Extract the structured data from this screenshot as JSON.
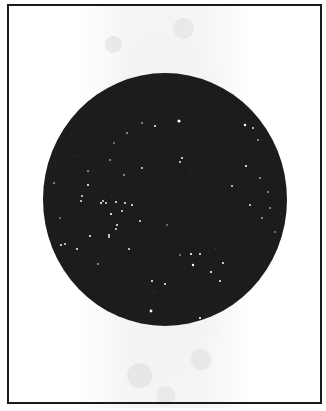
{
  "figure": {
    "frame_color": "#1a1a1a",
    "sky_color": "#1c1c1c",
    "star_color": "#ffffff",
    "circle": {
      "cx": 165,
      "cy": 199.5,
      "rx": 122,
      "ry": 126.5
    },
    "stars": [
      {
        "x": 179,
        "y": 121,
        "r": 1.6
      },
      {
        "x": 155,
        "y": 126,
        "r": 1.0
      },
      {
        "x": 245,
        "y": 125,
        "r": 1.2
      },
      {
        "x": 253,
        "y": 128,
        "r": 0.9
      },
      {
        "x": 258,
        "y": 140,
        "r": 0.8
      },
      {
        "x": 182,
        "y": 158,
        "r": 1.0
      },
      {
        "x": 180,
        "y": 162,
        "r": 0.9
      },
      {
        "x": 246,
        "y": 166,
        "r": 1.1
      },
      {
        "x": 260,
        "y": 178,
        "r": 0.8
      },
      {
        "x": 232,
        "y": 186,
        "r": 0.9
      },
      {
        "x": 268,
        "y": 192,
        "r": 0.8
      },
      {
        "x": 250,
        "y": 205,
        "r": 0.9
      },
      {
        "x": 270,
        "y": 208,
        "r": 0.8
      },
      {
        "x": 262,
        "y": 218,
        "r": 0.8
      },
      {
        "x": 142,
        "y": 123,
        "r": 0.8
      },
      {
        "x": 127,
        "y": 133,
        "r": 0.8
      },
      {
        "x": 114,
        "y": 143,
        "r": 0.7
      },
      {
        "x": 110,
        "y": 160,
        "r": 0.8
      },
      {
        "x": 142,
        "y": 168,
        "r": 0.9
      },
      {
        "x": 124,
        "y": 175,
        "r": 0.8
      },
      {
        "x": 88,
        "y": 171,
        "r": 0.8
      },
      {
        "x": 54,
        "y": 183,
        "r": 0.8
      },
      {
        "x": 88,
        "y": 185,
        "r": 1.1
      },
      {
        "x": 82,
        "y": 196,
        "r": 0.9
      },
      {
        "x": 81,
        "y": 201,
        "r": 0.9
      },
      {
        "x": 101,
        "y": 203,
        "r": 1.0
      },
      {
        "x": 103,
        "y": 201,
        "r": 0.9
      },
      {
        "x": 106,
        "y": 203,
        "r": 0.9
      },
      {
        "x": 116,
        "y": 202,
        "r": 1.0
      },
      {
        "x": 125,
        "y": 203,
        "r": 1.0
      },
      {
        "x": 122,
        "y": 211,
        "r": 0.9
      },
      {
        "x": 132,
        "y": 205,
        "r": 1.0
      },
      {
        "x": 111,
        "y": 214,
        "r": 1.1
      },
      {
        "x": 117,
        "y": 225,
        "r": 1.0
      },
      {
        "x": 116,
        "y": 229,
        "r": 0.9
      },
      {
        "x": 140,
        "y": 221,
        "r": 0.9
      },
      {
        "x": 109,
        "y": 235,
        "r": 1.0
      },
      {
        "x": 90,
        "y": 236,
        "r": 1.0
      },
      {
        "x": 109,
        "y": 237,
        "r": 0.9
      },
      {
        "x": 61,
        "y": 245,
        "r": 1.0
      },
      {
        "x": 65,
        "y": 244,
        "r": 0.9
      },
      {
        "x": 77,
        "y": 249,
        "r": 1.0
      },
      {
        "x": 129,
        "y": 249,
        "r": 0.9
      },
      {
        "x": 98,
        "y": 264,
        "r": 0.8
      },
      {
        "x": 191,
        "y": 254,
        "r": 1.1
      },
      {
        "x": 200,
        "y": 254,
        "r": 1.0
      },
      {
        "x": 193,
        "y": 265,
        "r": 1.2
      },
      {
        "x": 223,
        "y": 263,
        "r": 1.0
      },
      {
        "x": 211,
        "y": 272,
        "r": 1.1
      },
      {
        "x": 220,
        "y": 281,
        "r": 1.0
      },
      {
        "x": 152,
        "y": 281,
        "r": 1.0
      },
      {
        "x": 165,
        "y": 284,
        "r": 1.0
      },
      {
        "x": 151,
        "y": 311,
        "r": 1.4
      },
      {
        "x": 200,
        "y": 318,
        "r": 1.1
      },
      {
        "x": 180,
        "y": 255,
        "r": 0.7
      },
      {
        "x": 167,
        "y": 225,
        "r": 0.7
      },
      {
        "x": 60,
        "y": 218,
        "r": 0.7
      },
      {
        "x": 275,
        "y": 232,
        "r": 0.7
      }
    ]
  }
}
